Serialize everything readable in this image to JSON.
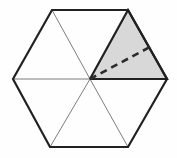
{
  "figure": {
    "name": "hexagon-with-shaded-sector",
    "canvas": {
      "width": 177,
      "height": 158,
      "background": "#fefefe"
    },
    "colors": {
      "outline": "#212121",
      "spoke": "#6e6e6e",
      "shade_fill": "#d8d8d8",
      "shade_outline": "#212121",
      "dashed_line": "#2b2b2b",
      "background": "#fefefe"
    },
    "stroke_widths": {
      "outline": 2.2,
      "spoke": 0.9,
      "dashed_line": 2.6
    },
    "dash_pattern": "7 5",
    "center": {
      "label": "center",
      "x": 90,
      "y": 79
    },
    "vertices": [
      {
        "label": "top-left",
        "x": 52,
        "y": 10
      },
      {
        "label": "top-right",
        "x": 128,
        "y": 10
      },
      {
        "label": "right",
        "x": 167,
        "y": 79
      },
      {
        "label": "bottom-right",
        "x": 128,
        "y": 147
      },
      {
        "label": "bottom-left",
        "x": 50,
        "y": 147
      },
      {
        "label": "left",
        "x": 13,
        "y": 79
      }
    ],
    "hexagon_path": "M52,10 L128,10 L167,79 L128,147 L50,147 L13,79 Z",
    "spokes": [
      {
        "label": "spoke-to-top-left",
        "x1": 90,
        "y1": 79,
        "x2": 52,
        "y2": 10
      },
      {
        "label": "spoke-to-top-right",
        "x1": 90,
        "y1": 79,
        "x2": 128,
        "y2": 10
      },
      {
        "label": "spoke-to-right",
        "x1": 90,
        "y1": 79,
        "x2": 167,
        "y2": 79
      },
      {
        "label": "spoke-to-bottom-right",
        "x1": 90,
        "y1": 79,
        "x2": 128,
        "y2": 147
      },
      {
        "label": "spoke-to-bottom-left",
        "x1": 90,
        "y1": 79,
        "x2": 50,
        "y2": 147
      },
      {
        "label": "spoke-to-left",
        "x1": 90,
        "y1": 79,
        "x2": 13,
        "y2": 79
      }
    ],
    "shaded_region": {
      "label": "upper-right-triangle",
      "path": "M90,79 L128,10 L167,79 Z",
      "fill": "#d8d8d8"
    },
    "dashed_segment": {
      "label": "dashed-chord",
      "x1": 90,
      "y1": 79,
      "x2": 150,
      "y2": 47
    }
  }
}
